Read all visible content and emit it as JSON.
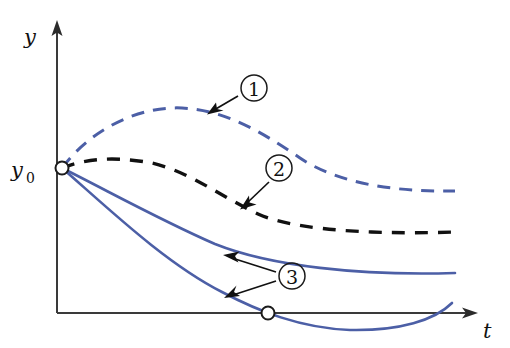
{
  "figure": {
    "background_color": "#ffffff"
  },
  "axes": {
    "y_axis": {
      "label": "y",
      "origin_x": 57,
      "top_y": 22,
      "bottom_y": 313,
      "has_arrowhead": true,
      "label_x": 27,
      "label_y": 40
    },
    "t_axis": {
      "label": "t",
      "left_x": 57,
      "right_x": 478,
      "y": 313,
      "has_arrowhead": true,
      "label_x": 484,
      "label_y": 334
    },
    "axis_color": "#3a3a3a"
  },
  "initial_point": {
    "label_main": "y",
    "label_sub": "0",
    "label_x": 12,
    "label_y": 176,
    "marker_x": 62,
    "marker_y": 168,
    "marker_radius": 6.5,
    "marker_style": "open-circle"
  },
  "t_axis_crossing_point": {
    "marker_x": 268,
    "marker_y": 313,
    "marker_radius": 6.5,
    "marker_style": "open-circle"
  },
  "colors": {
    "blue_curve": "#4c5fa6",
    "black_curve": "#111111",
    "axis": "#3a3a3a",
    "marker_fill": "#ffffff"
  },
  "curves": [
    {
      "id": "curve-1",
      "callout": "1",
      "style": "dashed",
      "color": "#4c5fa6",
      "description": "rises from y0 to a maximum then decreases, staying above the others",
      "path": "M 62 168 C 92 128 140 106 182 108 C 225 110 262 132 300 158 C 340 185 400 192 455 191"
    },
    {
      "id": "curve-2",
      "callout": "2",
      "style": "dashed",
      "color": "#111111",
      "description": "rises slightly from y0 to a small maximum then decreases toward a plateau",
      "path": "M 62 168 C 92 156 124 158 152 163 C 190 172 220 196 258 214 C 300 233 395 234 455 232"
    },
    {
      "id": "curve-3a",
      "callout": "3",
      "style": "solid",
      "color": "#4c5fa6",
      "description": "decreasing solution that flattens out above the t-axis",
      "path": "M 62 168 C 110 192 160 220 215 244 C 270 266 360 276 455 273"
    },
    {
      "id": "curve-3b",
      "callout": "3",
      "style": "solid",
      "color": "#4c5fa6",
      "description": "decreasing solution that crosses the t-axis, reaches a minimum and turns back up",
      "path": "M 62 168 C 108 208 165 263 222 292 C 258 311 300 328 350 330 C 400 331 435 320 452 303"
    }
  ],
  "callouts": [
    {
      "id": "callout-1",
      "label": "1",
      "circle_cx": 254,
      "circle_cy": 88,
      "circle_r": 13,
      "pointer_from_x": 238,
      "pointer_from_y": 96,
      "pointer_to_x": 210,
      "pointer_to_y": 113,
      "targets": [
        "curve-1"
      ]
    },
    {
      "id": "callout-2",
      "label": "2",
      "circle_cx": 279,
      "circle_cy": 168,
      "circle_r": 13,
      "pointer_from_x": 269,
      "pointer_from_y": 182,
      "pointer_to_x": 243,
      "pointer_to_y": 207,
      "targets": [
        "curve-2"
      ]
    },
    {
      "id": "callout-3",
      "label": "3",
      "circle_cx": 292,
      "circle_cy": 276,
      "circle_r": 13,
      "pointer_from_x": 276,
      "pointer_from_y": 272,
      "pointer_to_x": 226,
      "pointer_to_y": 256,
      "pointer2_from_x": 276,
      "pointer2_from_y": 281,
      "pointer2_to_x": 228,
      "pointer2_to_y": 297,
      "targets": [
        "curve-3a",
        "curve-3b"
      ]
    }
  ]
}
